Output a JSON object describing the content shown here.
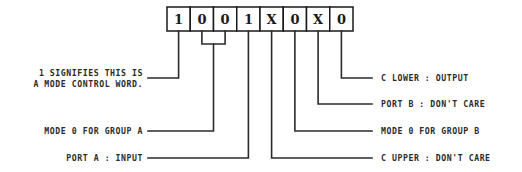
{
  "diagram": {
    "colors": {
      "background": "#ffffff",
      "line": "#2b2b2b",
      "box_border": "#1a1a1a",
      "text": "#2b2b2b"
    },
    "control_word": {
      "bits": [
        {
          "index": 0,
          "value": "1"
        },
        {
          "index": 1,
          "value": "0"
        },
        {
          "index": 2,
          "value": "0"
        },
        {
          "index": 3,
          "value": "1"
        },
        {
          "index": 4,
          "value": "X"
        },
        {
          "index": 5,
          "value": "0"
        },
        {
          "index": 6,
          "value": "X"
        },
        {
          "index": 7,
          "value": "0"
        }
      ]
    },
    "annotations": {
      "left": [
        {
          "id": "mode-control-word",
          "line1": "1 SIGNIFIES THIS IS",
          "line2": "A MODE CONTROL WORD."
        },
        {
          "id": "mode-0-group-a",
          "line1": "MODE 0 FOR GROUP A",
          "line2": ""
        },
        {
          "id": "port-a-input",
          "line1": "PORT A : INPUT",
          "line2": ""
        }
      ],
      "right": [
        {
          "id": "c-lower-output",
          "text": "C LOWER : OUTPUT"
        },
        {
          "id": "port-b-dont-care",
          "text": "PORT B : DON'T CARE"
        },
        {
          "id": "mode-0-group-b",
          "text": "MODE 0 FOR GROUP B"
        },
        {
          "id": "c-upper-dont-care",
          "text": "C UPPER : DON'T CARE"
        }
      ]
    }
  }
}
